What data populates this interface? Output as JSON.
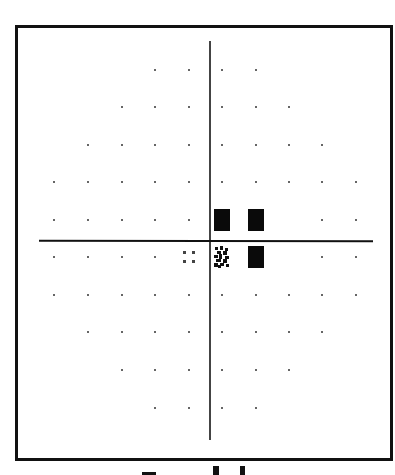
{
  "figure": {
    "type": "visual-field-grayscale-plot",
    "grid": {
      "columns_x": [
        54,
        88,
        122,
        155,
        189,
        222,
        256,
        289,
        322,
        356
      ],
      "rows_y": [
        70,
        107,
        145,
        182,
        220,
        257,
        295,
        332,
        370,
        408
      ],
      "rows": [
        [
          "",
          "",
          "",
          "dot",
          "dot",
          "dot",
          "dot",
          "",
          "",
          ""
        ],
        [
          "",
          "",
          "dot",
          "dot",
          "dot",
          "dot",
          "dot",
          "dot",
          "",
          ""
        ],
        [
          "",
          "dot",
          "dot",
          "dot",
          "dot",
          "dot",
          "dot",
          "dot",
          "dot",
          ""
        ],
        [
          "dot",
          "dot",
          "dot",
          "dot",
          "dot",
          "dot",
          "dot",
          "dot",
          "dot",
          "dot"
        ],
        [
          "dot",
          "dot",
          "dot",
          "dot",
          "dot",
          "black",
          "black",
          "",
          "dot",
          "dot"
        ],
        [
          "dot",
          "dot",
          "dot",
          "dot",
          "four-dot",
          "pattern",
          "black",
          "",
          "dot",
          "dot"
        ],
        [
          "dot",
          "dot",
          "dot",
          "dot",
          "dot",
          "dot",
          "dot",
          "dot",
          "dot",
          "dot"
        ],
        [
          "",
          "dot",
          "dot",
          "dot",
          "dot",
          "dot",
          "dot",
          "dot",
          "dot",
          ""
        ],
        [
          "",
          "",
          "dot",
          "dot",
          "dot",
          "dot",
          "dot",
          "dot",
          "",
          ""
        ],
        [
          "",
          "",
          "",
          "dot",
          "dot",
          "dot",
          "dot",
          "",
          "",
          ""
        ]
      ]
    },
    "symbols": {
      "dot": "normal-sensitivity",
      "four-dot": "mild-depression",
      "pattern": "moderate-depression",
      "black": "absolute-defect"
    },
    "colors": {
      "frame": "#111111",
      "axes": "#222222",
      "defect": "#0a0a0a",
      "background": "#ffffff"
    },
    "caption_partial": "cropped text (only letter tops visible)"
  }
}
